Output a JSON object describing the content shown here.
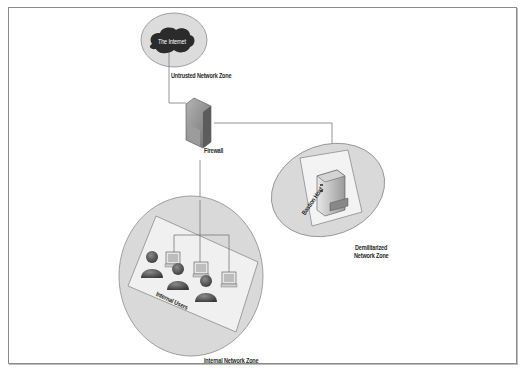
{
  "diagram": {
    "title": "",
    "nodes": {
      "internet": {
        "label": "The Internet",
        "zone": "Untrusted Network Zone"
      },
      "firewall": {
        "label": "Firewall"
      },
      "bastion": {
        "label": "Bastion Host",
        "zone_line1": "Demilitarized",
        "zone_line2": "Network Zone"
      },
      "users": {
        "label": "Internal Users",
        "zone": "Internal Network Zone",
        "count": 3
      }
    },
    "edges": [
      {
        "from": "internet",
        "to": "firewall"
      },
      {
        "from": "firewall",
        "to": "bastion"
      },
      {
        "from": "firewall",
        "to": "users"
      }
    ],
    "colors": {
      "zone_fill": "#d9d9d9",
      "zone_stroke": "#8c8c8c",
      "line": "#7a7a7a",
      "cloud": "#2b2b2b",
      "person": "#5a5a5a"
    }
  }
}
